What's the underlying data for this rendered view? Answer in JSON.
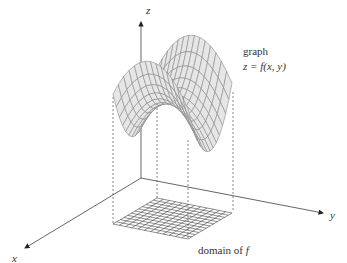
{
  "labels": {
    "z_axis": "z",
    "y_axis": "y",
    "x_axis": "x",
    "graph_title": "graph",
    "graph_eq": "z = f(x, y)",
    "domain": "domain of ",
    "domain_f": "f"
  },
  "colors": {
    "surface_fill": "#e6e6e6",
    "mesh": "#8a8a8a",
    "axis": "#555555",
    "text": "#333333"
  }
}
